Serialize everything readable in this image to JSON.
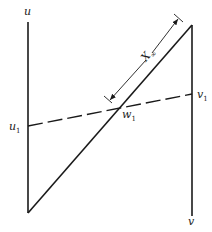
{
  "diagram": {
    "axes": {
      "left": {
        "label": "u",
        "marker_label": "u",
        "marker_sub": "1"
      },
      "right": {
        "label": "v",
        "marker_label": "v",
        "marker_sub": "1"
      }
    },
    "intersection": {
      "label": "w",
      "sub": "1"
    },
    "dimension": {
      "label": "X",
      "sub": "∞"
    },
    "colors": {
      "ink": "#1a1a1a",
      "background": "#ffffff"
    }
  }
}
